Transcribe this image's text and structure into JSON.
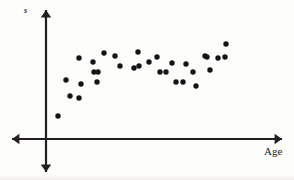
{
  "figure": {
    "width": 294,
    "height": 180,
    "background_color": "#fdfdfc",
    "ink_color": "#231f20"
  },
  "axes": {
    "origin": {
      "x": 46,
      "y": 139
    },
    "x_axis": {
      "start_x": 12,
      "end_x": 282,
      "y": 139,
      "arrow_left": true,
      "arrow_right": true
    },
    "y_axis": {
      "x": 46,
      "start_y": 10,
      "end_y": 172,
      "arrow_up": true,
      "arrow_down": true
    },
    "line_width": 2.2
  },
  "labels": {
    "y_axis_label": "s",
    "x_axis_label": "Age"
  },
  "chart_data": {
    "type": "scatter",
    "title": "",
    "xlabel": "Age",
    "ylabel": "s",
    "grid": false,
    "legend": null,
    "axis_ticks": {
      "x": [],
      "y": []
    },
    "xlim": [
      46,
      282
    ],
    "ylim": [
      139,
      10
    ],
    "marker": {
      "shape": "circle",
      "radius": 2.7,
      "color": "#151515"
    },
    "point_count": 32,
    "points": [
      {
        "x": 58,
        "y": 116
      },
      {
        "x": 66,
        "y": 80
      },
      {
        "x": 70,
        "y": 96
      },
      {
        "x": 79,
        "y": 58
      },
      {
        "x": 79,
        "y": 98
      },
      {
        "x": 81,
        "y": 84
      },
      {
        "x": 93,
        "y": 62
      },
      {
        "x": 94,
        "y": 72
      },
      {
        "x": 97,
        "y": 82
      },
      {
        "x": 98,
        "y": 72
      },
      {
        "x": 104,
        "y": 53
      },
      {
        "x": 115,
        "y": 56
      },
      {
        "x": 120,
        "y": 66
      },
      {
        "x": 134,
        "y": 68
      },
      {
        "x": 138,
        "y": 52
      },
      {
        "x": 139,
        "y": 66
      },
      {
        "x": 149,
        "y": 62
      },
      {
        "x": 157,
        "y": 57
      },
      {
        "x": 160,
        "y": 72
      },
      {
        "x": 166,
        "y": 72
      },
      {
        "x": 172,
        "y": 63
      },
      {
        "x": 176,
        "y": 82
      },
      {
        "x": 183,
        "y": 82
      },
      {
        "x": 186,
        "y": 64
      },
      {
        "x": 193,
        "y": 72
      },
      {
        "x": 196,
        "y": 86
      },
      {
        "x": 205,
        "y": 56
      },
      {
        "x": 207,
        "y": 57
      },
      {
        "x": 210,
        "y": 70
      },
      {
        "x": 218,
        "y": 58
      },
      {
        "x": 225,
        "y": 57
      },
      {
        "x": 226,
        "y": 44
      }
    ]
  }
}
